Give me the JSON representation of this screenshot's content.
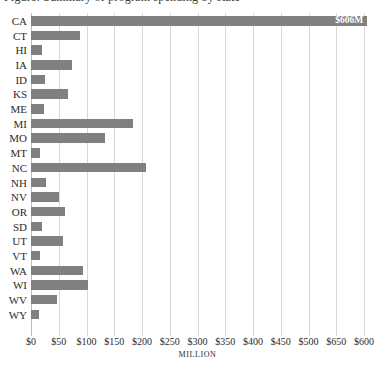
{
  "headline": "Figure: Summary of program spending by state",
  "chart_data": {
    "type": "bar",
    "orientation": "horizontal",
    "title": "",
    "xlabel": "MILLION",
    "ylabel": "",
    "xlim": [
      0,
      600
    ],
    "grid": true,
    "legend": false,
    "bar_color": "#808080",
    "categories": [
      "CA",
      "CT",
      "HI",
      "IA",
      "ID",
      "KS",
      "ME",
      "MI",
      "MO",
      "MT",
      "NC",
      "NH",
      "NV",
      "OR",
      "SD",
      "UT",
      "VT",
      "WA",
      "WI",
      "WV",
      "WY"
    ],
    "values": [
      606,
      88,
      20,
      74,
      25,
      67,
      24,
      184,
      133,
      17,
      207,
      27,
      51,
      62,
      20,
      57,
      17,
      93,
      102,
      47,
      15
    ],
    "xticks": [
      0,
      50,
      100,
      150,
      200,
      250,
      300,
      350,
      400,
      450,
      500,
      550,
      600
    ],
    "xticklabels": [
      "$0",
      "$50",
      "$100",
      "$150",
      "$200",
      "$250",
      "$300",
      "$350",
      "$400",
      "$450",
      "$500",
      "$650",
      "$600"
    ],
    "data_labels": [
      {
        "category": "CA",
        "text": "$606M"
      }
    ]
  }
}
